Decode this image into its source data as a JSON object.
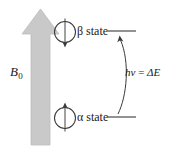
{
  "figure": {
    "field_arrow": {
      "name": "magnetic-field-arrow",
      "label": "B",
      "subscript": "0",
      "color": "#c9c9c9",
      "direction": "up"
    },
    "states": [
      {
        "id": "beta",
        "symbol": "β",
        "label": "β state",
        "spin_direction": "down",
        "energy_level": "upper"
      },
      {
        "id": "alpha",
        "symbol": "α",
        "label": "α state",
        "spin_direction": "up",
        "energy_level": "lower"
      }
    ],
    "transition": {
      "name": "energy-transition",
      "label": "hν = ΔE",
      "h": "h",
      "nu": "ν",
      "equals": "=",
      "delta_e": "ΔE",
      "arrow_direction": "up"
    },
    "colors": {
      "line": "#3a3a3a",
      "arrow_fill": "#c9c9c9",
      "arrow_stroke": "#b4b4b4",
      "text": "#1a1a1a",
      "background": "#ffffff"
    }
  }
}
